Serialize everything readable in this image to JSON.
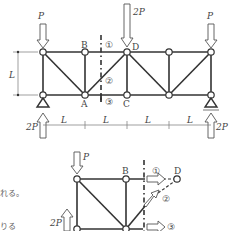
{
  "diagram": {
    "type": "truss",
    "upper_figure": {
      "loads": [
        {
          "node": "top-left",
          "label": "P",
          "direction": "down"
        },
        {
          "node": "D",
          "label": "2P",
          "direction": "down"
        },
        {
          "node": "top-right",
          "label": "P",
          "direction": "down"
        }
      ],
      "reactions": [
        {
          "node": "bottom-left",
          "label": "2P",
          "direction": "up"
        },
        {
          "node": "bottom-right",
          "label": "2P",
          "direction": "up"
        }
      ],
      "node_labels": {
        "A": "A",
        "B": "B",
        "C": "C",
        "D": "D"
      },
      "height_label": "L",
      "span_labels": [
        "L",
        "L",
        "L",
        "L"
      ],
      "section_marks": [
        "①",
        "②",
        "③"
      ]
    },
    "lower_figure": {
      "load_label": "P",
      "reaction_label": "2P",
      "node_labels": {
        "A": "A",
        "B": "B",
        "D": "D"
      },
      "member_forces": [
        "①",
        "②",
        "③"
      ]
    },
    "text_fragments": [
      "れる。",
      "りる"
    ]
  }
}
